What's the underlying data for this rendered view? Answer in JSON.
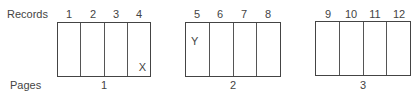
{
  "labels": {
    "records": "Records",
    "pages": "Pages"
  },
  "pages": [
    {
      "number": "1",
      "records": [
        "1",
        "2",
        "3",
        "4"
      ]
    },
    {
      "number": "2",
      "records": [
        "5",
        "6",
        "7",
        "8"
      ]
    },
    {
      "number": "3",
      "records": [
        "9",
        "10",
        "11",
        "12"
      ]
    }
  ],
  "marks": {
    "x": "X",
    "y": "Y"
  }
}
